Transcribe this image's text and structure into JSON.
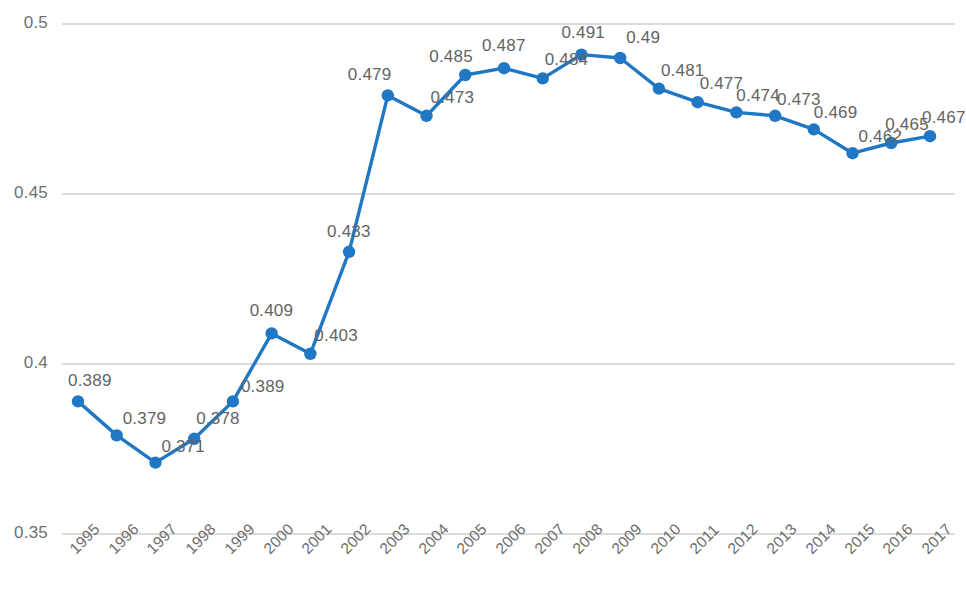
{
  "chart_data": {
    "type": "line",
    "title": "",
    "subtitle": "",
    "xlabel": "",
    "ylabel": "",
    "categories": [
      "1995",
      "1996",
      "1997",
      "1998",
      "1999",
      "2000",
      "2001",
      "2002",
      "2003",
      "2004",
      "2005",
      "2006",
      "2007",
      "2008",
      "2009",
      "2010",
      "2011",
      "2012",
      "2013",
      "2014",
      "2015",
      "2016",
      "2017"
    ],
    "values": [
      0.389,
      0.379,
      0.371,
      0.378,
      0.389,
      0.409,
      0.403,
      0.433,
      0.479,
      0.473,
      0.485,
      0.487,
      0.484,
      0.491,
      0.49,
      0.481,
      0.477,
      0.474,
      0.473,
      0.469,
      0.462,
      0.465,
      0.467
    ],
    "data_labels": [
      "0.389",
      "0.379",
      "0.371",
      "0.378",
      "0.389",
      "0.409",
      "0.403",
      "0.433",
      "0.479",
      "0.473",
      "0.485",
      "0.487",
      "0.484",
      "0.491",
      "0.49",
      "0.481",
      "0.477",
      "0.474",
      "0.473",
      "0.469",
      "0.462",
      "0.465",
      "0.467"
    ],
    "ylim": [
      0.35,
      0.5
    ],
    "yticks": [
      0.35,
      0.4,
      0.45,
      0.5
    ],
    "ytick_labels": [
      "0.35",
      "0.4",
      "0.45",
      "0.5"
    ],
    "grid": true,
    "legend": false,
    "legend_position": "none",
    "series": [
      {
        "name": "",
        "values": [
          0.389,
          0.379,
          0.371,
          0.378,
          0.389,
          0.409,
          0.403,
          0.433,
          0.479,
          0.473,
          0.485,
          0.487,
          0.484,
          0.491,
          0.49,
          0.481,
          0.477,
          0.474,
          0.473,
          0.469,
          0.462,
          0.465,
          0.467
        ],
        "color": "#2077c4",
        "marker": "circle"
      }
    ],
    "colors": {
      "line": "#2077c4",
      "marker": "#2077c4",
      "gridline": "#b8b8b8",
      "axis_text": "#6e6e6e",
      "data_label_text": "#646464",
      "background": "#ffffff"
    },
    "label_offsets": [
      {
        "dx": -10,
        "dy": -30,
        "align": "left"
      },
      {
        "dx": 6,
        "dy": -26,
        "align": "left"
      },
      {
        "dx": 6,
        "dy": -26,
        "align": "left"
      },
      {
        "dx": 2,
        "dy": -30,
        "align": "left"
      },
      {
        "dx": 8,
        "dy": -24,
        "align": "left"
      },
      {
        "dx": -22,
        "dy": -32,
        "align": "left"
      },
      {
        "dx": 4,
        "dy": -28,
        "align": "left"
      },
      {
        "dx": -22,
        "dy": -30,
        "align": "left"
      },
      {
        "dx": -40,
        "dy": -30,
        "align": "left"
      },
      {
        "dx": 4,
        "dy": -28,
        "align": "left"
      },
      {
        "dx": -36,
        "dy": -28,
        "align": "left"
      },
      {
        "dx": -22,
        "dy": -32,
        "align": "left"
      },
      {
        "dx": 2,
        "dy": -28,
        "align": "left"
      },
      {
        "dx": -20,
        "dy": -32,
        "align": "left"
      },
      {
        "dx": 6,
        "dy": -30,
        "align": "left"
      },
      {
        "dx": 2,
        "dy": -28,
        "align": "left"
      },
      {
        "dx": 2,
        "dy": -28,
        "align": "left"
      },
      {
        "dx": 0,
        "dy": -26,
        "align": "left"
      },
      {
        "dx": 2,
        "dy": -26,
        "align": "left"
      },
      {
        "dx": 0,
        "dy": -26,
        "align": "left"
      },
      {
        "dx": 6,
        "dy": -26,
        "align": "left"
      },
      {
        "dx": -6,
        "dy": -28,
        "align": "left"
      },
      {
        "dx": -8,
        "dy": -28,
        "align": "left"
      }
    ]
  }
}
